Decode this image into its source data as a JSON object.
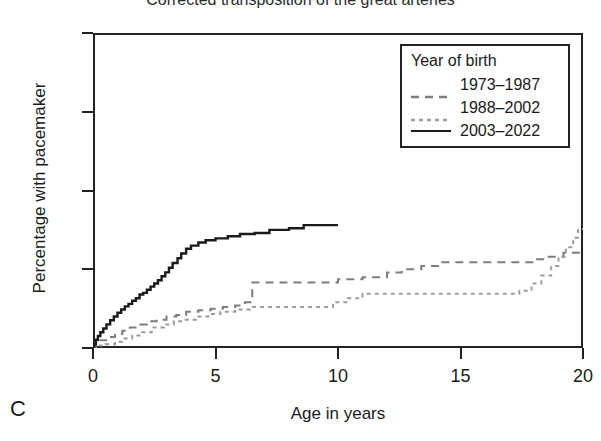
{
  "panel_label": "C",
  "title": "Corrected transposition of the great arteries",
  "axes": {
    "ylabel": "Percentage with pacemaker",
    "xlabel": "Age in years",
    "yticks": [
      "0",
      "25",
      "50",
      "75",
      "100"
    ],
    "xticks": [
      "0",
      "5",
      "10",
      "15",
      "20"
    ]
  },
  "legend": {
    "title": "Year of birth",
    "items": [
      {
        "label": "1973–1987",
        "style": "dashed",
        "color": "#7d7d7d"
      },
      {
        "label": "1988–2002",
        "style": "fine-dashed",
        "color": "#9b9b9b"
      },
      {
        "label": "2003–2022",
        "style": "solid",
        "color": "#1a1a1a"
      }
    ]
  },
  "chart_data": {
    "type": "line",
    "title": "Corrected transposition of the great arteries",
    "xlabel": "Age in years",
    "ylabel": "Percentage with pacemaker",
    "xlim": [
      0,
      20
    ],
    "ylim": [
      0,
      100
    ],
    "xticks": [
      0,
      5,
      10,
      15,
      20
    ],
    "yticks": [
      0,
      25,
      50,
      75,
      100
    ],
    "grid": false,
    "legend_title": "Year of birth",
    "legend_position": "top-right",
    "step_style": "post",
    "series": [
      {
        "name": "1973–1987",
        "color": "#7d7d7d",
        "dash": "8,6",
        "points": [
          [
            0.0,
            0.0
          ],
          [
            0.1,
            1.5
          ],
          [
            0.3,
            2.5
          ],
          [
            0.6,
            3.5
          ],
          [
            0.9,
            4.5
          ],
          [
            1.2,
            5.5
          ],
          [
            1.5,
            6.5
          ],
          [
            1.8,
            7.5
          ],
          [
            2.2,
            8.5
          ],
          [
            2.6,
            9.0
          ],
          [
            3.0,
            10.0
          ],
          [
            3.4,
            10.5
          ],
          [
            3.8,
            11.5
          ],
          [
            4.3,
            12.0
          ],
          [
            4.8,
            12.5
          ],
          [
            5.3,
            13.0
          ],
          [
            5.8,
            13.5
          ],
          [
            6.2,
            14.5
          ],
          [
            6.5,
            20.8
          ],
          [
            9.5,
            20.8
          ],
          [
            10.0,
            21.8
          ],
          [
            11.0,
            22.5
          ],
          [
            12.0,
            24.0
          ],
          [
            12.6,
            25.0
          ],
          [
            13.4,
            26.0
          ],
          [
            14.2,
            27.2
          ],
          [
            17.5,
            27.2
          ],
          [
            18.0,
            28.2
          ],
          [
            18.6,
            29.0
          ],
          [
            19.2,
            30.2
          ],
          [
            20.0,
            30.2
          ]
        ]
      },
      {
        "name": "1988–2002",
        "color": "#9b9b9b",
        "dash": "4,4",
        "points": [
          [
            0.0,
            0.0
          ],
          [
            0.2,
            0.8
          ],
          [
            0.5,
            1.2
          ],
          [
            0.9,
            2.0
          ],
          [
            1.2,
            3.0
          ],
          [
            1.6,
            4.0
          ],
          [
            2.0,
            5.0
          ],
          [
            2.4,
            6.5
          ],
          [
            2.9,
            7.5
          ],
          [
            3.3,
            8.5
          ],
          [
            3.7,
            9.0
          ],
          [
            4.2,
            10.0
          ],
          [
            4.7,
            10.8
          ],
          [
            5.2,
            11.5
          ],
          [
            5.8,
            12.2
          ],
          [
            6.4,
            13.0
          ],
          [
            9.4,
            13.0
          ],
          [
            9.8,
            14.5
          ],
          [
            10.4,
            15.8
          ],
          [
            11.0,
            17.2
          ],
          [
            16.8,
            17.2
          ],
          [
            17.4,
            18.2
          ],
          [
            17.9,
            20.5
          ],
          [
            18.3,
            23.0
          ],
          [
            18.7,
            26.0
          ],
          [
            19.0,
            29.0
          ],
          [
            19.3,
            32.0
          ],
          [
            19.6,
            35.0
          ],
          [
            19.8,
            37.8
          ],
          [
            20.0,
            37.8
          ]
        ]
      },
      {
        "name": "2003–2022",
        "color": "#1a1a1a",
        "dash": "",
        "points": [
          [
            0.0,
            0.0
          ],
          [
            0.05,
            1.2
          ],
          [
            0.12,
            2.6
          ],
          [
            0.2,
            3.8
          ],
          [
            0.3,
            5.0
          ],
          [
            0.42,
            6.2
          ],
          [
            0.55,
            7.5
          ],
          [
            0.7,
            8.8
          ],
          [
            0.85,
            10.0
          ],
          [
            1.0,
            11.2
          ],
          [
            1.15,
            12.2
          ],
          [
            1.3,
            13.2
          ],
          [
            1.45,
            14.0
          ],
          [
            1.6,
            15.0
          ],
          [
            1.75,
            15.8
          ],
          [
            1.9,
            17.0
          ],
          [
            2.05,
            17.5
          ],
          [
            2.2,
            18.5
          ],
          [
            2.35,
            19.5
          ],
          [
            2.5,
            20.5
          ],
          [
            2.65,
            21.5
          ],
          [
            2.8,
            22.8
          ],
          [
            2.95,
            24.0
          ],
          [
            3.1,
            25.5
          ],
          [
            3.25,
            27.0
          ],
          [
            3.45,
            28.5
          ],
          [
            3.6,
            30.0
          ],
          [
            3.8,
            31.5
          ],
          [
            4.0,
            32.5
          ],
          [
            4.3,
            33.5
          ],
          [
            4.6,
            34.2
          ],
          [
            5.0,
            34.8
          ],
          [
            5.5,
            35.5
          ],
          [
            6.0,
            36.2
          ],
          [
            6.6,
            36.5
          ],
          [
            7.2,
            37.5
          ],
          [
            8.0,
            38.0
          ],
          [
            8.6,
            39.0
          ],
          [
            10.0,
            39.0
          ]
        ]
      }
    ]
  }
}
